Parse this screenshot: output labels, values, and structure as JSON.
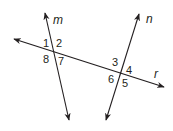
{
  "diagram": {
    "type": "transversal-angles",
    "lines": [
      {
        "name": "m",
        "label": "m",
        "x1": 45,
        "y1": 13,
        "x2": 69,
        "y2": 120
      },
      {
        "name": "n",
        "label": "n",
        "x1": 139,
        "y1": 14,
        "x2": 106,
        "y2": 120
      },
      {
        "name": "r",
        "label": "r",
        "x1": 14,
        "y1": 39,
        "x2": 164,
        "y2": 87
      }
    ],
    "line_color": "#231f20",
    "angles": [
      {
        "label": "1",
        "x": 43,
        "y": 47
      },
      {
        "label": "2",
        "x": 56,
        "y": 47
      },
      {
        "label": "8",
        "x": 43,
        "y": 63
      },
      {
        "label": "7",
        "x": 58,
        "y": 65
      },
      {
        "label": "3",
        "x": 112,
        "y": 66
      },
      {
        "label": "4",
        "x": 126,
        "y": 74
      },
      {
        "label": "6",
        "x": 108,
        "y": 83
      },
      {
        "label": "5",
        "x": 122,
        "y": 87
      }
    ],
    "line_labels": [
      {
        "label": "m",
        "x": 53,
        "y": 24
      },
      {
        "label": "n",
        "x": 146,
        "y": 23
      },
      {
        "label": "r",
        "x": 154,
        "y": 78
      }
    ]
  }
}
